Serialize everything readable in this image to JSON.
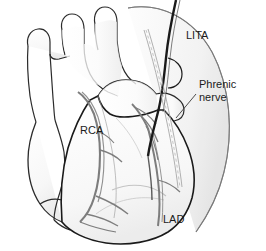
{
  "figure": {
    "name": "cardiac-anatomy-lita-graft-illustration",
    "background_color": "#ffffff",
    "width": 266,
    "height": 251
  },
  "labels": {
    "lita": "LITA",
    "phrenic_line1": "Phrenic",
    "phrenic_line2": "nerve",
    "rca": "RCA",
    "lad": "LAD"
  },
  "colors": {
    "outline": "#1a1a1a",
    "vessel_gray": "#8a8a8a",
    "coronary_gray": "#7d7d7d",
    "pericardium": "#9a9a9a",
    "phrenic": "#a8a8a8",
    "fill_light": "#fbfbfb",
    "fill_shade": "#f0f0f0",
    "fill_shade2": "#e6e6e6",
    "text": "#1b1b1b",
    "background": "#ffffff"
  },
  "structures": [
    {
      "name": "aortic-arch",
      "label_shown": false
    },
    {
      "name": "brachiocephalic-branches",
      "label_shown": false
    },
    {
      "name": "superior-vena-cava",
      "label_shown": false
    },
    {
      "name": "right-atrium",
      "label_shown": false
    },
    {
      "name": "inferior-vena-cava",
      "label_shown": false
    },
    {
      "name": "pulmonary-artery-trunk",
      "label_shown": false
    },
    {
      "name": "left-ventricle",
      "label_shown": false
    },
    {
      "name": "right-ventricle",
      "label_shown": false
    },
    {
      "name": "pericardial-edge",
      "label_shown": false
    },
    {
      "name": "lita-graft",
      "label_shown": true,
      "label": "LITA"
    },
    {
      "name": "phrenic-nerve",
      "label_shown": true,
      "label": "Phrenic nerve"
    },
    {
      "name": "right-coronary-artery",
      "label_shown": true,
      "label": "RCA"
    },
    {
      "name": "left-anterior-descending-artery",
      "label_shown": true,
      "label": "LAD"
    }
  ]
}
